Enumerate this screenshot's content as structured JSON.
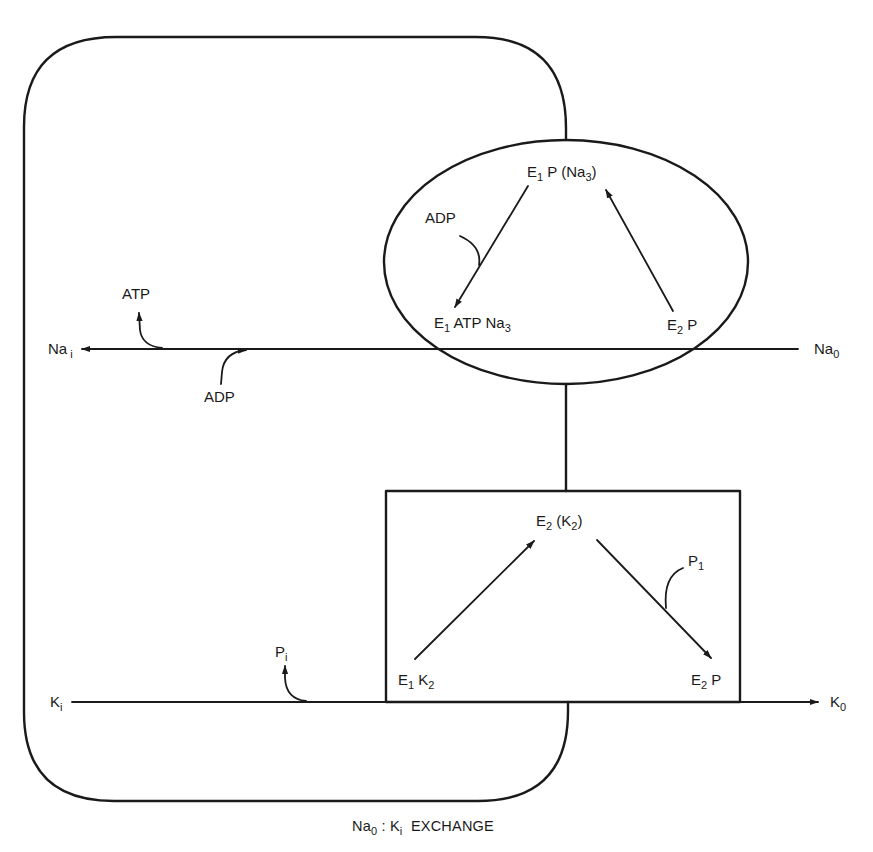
{
  "figure": {
    "title": "Na0 : Ki EXCHANGE",
    "caption": {
      "main": "Na",
      "main_sub": "0",
      "sep": " : ",
      "second": "K",
      "second_sub": "i",
      "rest": "  EXCHANGE"
    }
  },
  "circle_cycle": {
    "top": {
      "base": "E",
      "sub1": "1",
      "mid": " P (Na",
      "sub2": "3",
      "end": ")"
    },
    "left": {
      "base": "E",
      "sub1": "1",
      "mid": " ATP Na",
      "sub2": "3"
    },
    "right": {
      "base": "E",
      "sub1": "2",
      "mid": " P"
    },
    "side_reactant": "ADP"
  },
  "box_cycle": {
    "top": {
      "base": "E",
      "sub1": "2",
      "mid": " (K",
      "sub2": "2",
      "end": ")"
    },
    "left": {
      "base": "E",
      "sub1": "1",
      "mid": " K",
      "sub2": "2"
    },
    "right": {
      "base": "E",
      "sub1": "2",
      "mid": " P"
    },
    "side_product": {
      "base": "P",
      "sub": "1"
    }
  },
  "na_line": {
    "left_label": {
      "base": "Na",
      "sub": "i"
    },
    "right_label": {
      "base": "Na",
      "sub": "0"
    },
    "product_out": "ATP",
    "reactant_in": "ADP"
  },
  "k_line": {
    "left_label": {
      "base": "K",
      "sub": "i"
    },
    "right_label": {
      "base": "K",
      "sub": "0"
    },
    "reactant_in": {
      "base": "P",
      "sub": "i"
    }
  },
  "colors": {
    "ink": "#1a1a1a",
    "background": "#ffffff"
  }
}
